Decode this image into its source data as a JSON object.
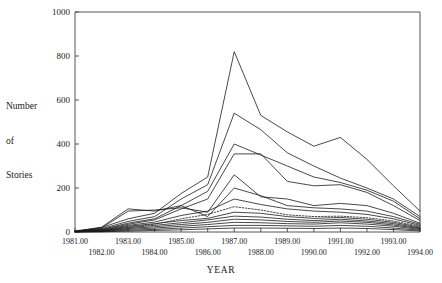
{
  "chart_data": {
    "type": "line",
    "title": "",
    "xlabel": "YEAR",
    "ylabel": "Number\nof\nStories",
    "ylabel_lines": [
      "Number",
      "of",
      "Stories"
    ],
    "x": [
      1981,
      1982,
      1983,
      1984,
      1985,
      1986,
      1987,
      1988,
      1989,
      1990,
      1991,
      1992,
      1993,
      1994
    ],
    "xtick_labels": [
      "1981.00",
      "1982.00",
      "1983.00",
      "1984.00",
      "1985.00",
      "1986.00",
      "1987.00",
      "1988.00",
      "1989.00",
      "1990.00",
      "1991.00",
      "1992.00",
      "1993.00",
      "1994.00"
    ],
    "xtick_rows": [
      0,
      1,
      0,
      1,
      0,
      1,
      0,
      1,
      0,
      1,
      0,
      1,
      0,
      1
    ],
    "ytick_labels": [
      "0",
      "200",
      "400",
      "600",
      "800",
      "1000"
    ],
    "ytick_values": [
      0,
      200,
      400,
      600,
      800,
      1000
    ],
    "xlim": [
      1981,
      1994
    ],
    "ylim": [
      0,
      1000
    ],
    "grid": false,
    "legend": "none",
    "line_color": "#1a1a1a",
    "series": [
      {
        "name": "series-1",
        "style": "solid",
        "values": [
          5,
          20,
          60,
          85,
          175,
          250,
          820,
          530,
          455,
          390,
          430,
          330,
          210,
          95
        ]
      },
      {
        "name": "series-2",
        "style": "solid",
        "values": [
          4,
          15,
          48,
          70,
          150,
          215,
          540,
          465,
          360,
          300,
          245,
          200,
          150,
          70
        ]
      },
      {
        "name": "series-3",
        "style": "solid",
        "values": [
          3,
          12,
          40,
          60,
          120,
          185,
          400,
          350,
          300,
          250,
          225,
          190,
          140,
          60
        ]
      },
      {
        "name": "series-4",
        "style": "solid",
        "values": [
          3,
          10,
          35,
          55,
          105,
          150,
          355,
          355,
          230,
          210,
          215,
          180,
          120,
          52
        ]
      },
      {
        "name": "series-5",
        "style": "solid",
        "values": [
          2,
          18,
          95,
          100,
          110,
          90,
          260,
          160,
          150,
          120,
          130,
          120,
          85,
          40
        ]
      },
      {
        "name": "series-6",
        "style": "solid",
        "values": [
          2,
          22,
          105,
          95,
          120,
          70,
          200,
          165,
          120,
          110,
          105,
          95,
          70,
          35
        ]
      },
      {
        "name": "series-7",
        "style": "solid",
        "values": [
          2,
          8,
          30,
          45,
          75,
          95,
          150,
          125,
          105,
          95,
          90,
          80,
          60,
          30
        ]
      },
      {
        "name": "series-8",
        "style": "dotted",
        "values": [
          2,
          6,
          22,
          35,
          60,
          80,
          115,
          100,
          78,
          70,
          72,
          65,
          50,
          26
        ]
      },
      {
        "name": "series-9",
        "style": "solid",
        "values": [
          2,
          6,
          26,
          38,
          52,
          62,
          90,
          85,
          70,
          62,
          66,
          58,
          44,
          22
        ]
      },
      {
        "name": "series-10",
        "style": "solid",
        "values": [
          1,
          5,
          20,
          30,
          42,
          55,
          72,
          68,
          58,
          52,
          58,
          50,
          38,
          18
        ]
      },
      {
        "name": "series-11",
        "style": "solid",
        "values": [
          1,
          4,
          16,
          24,
          34,
          44,
          58,
          55,
          48,
          44,
          50,
          44,
          32,
          15
        ]
      },
      {
        "name": "series-12",
        "style": "solid",
        "values": [
          1,
          3,
          12,
          18,
          26,
          34,
          44,
          42,
          38,
          36,
          42,
          36,
          26,
          12
        ]
      },
      {
        "name": "series-13",
        "style": "solid",
        "values": [
          1,
          2,
          8,
          12,
          18,
          24,
          30,
          30,
          28,
          26,
          30,
          26,
          18,
          8
        ]
      },
      {
        "name": "series-14",
        "style": "solid",
        "values": [
          0,
          1,
          4,
          7,
          10,
          14,
          18,
          18,
          17,
          16,
          18,
          16,
          11,
          5
        ]
      }
    ]
  }
}
